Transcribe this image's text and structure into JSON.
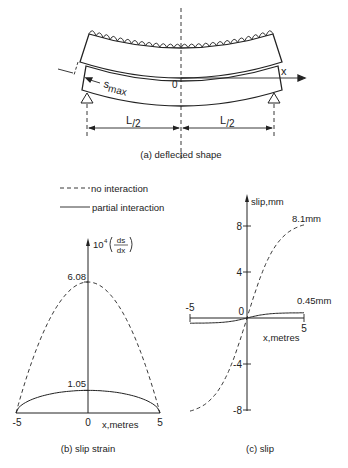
{
  "diagram_a": {
    "caption": "(a) deflected shape",
    "axis_label": "x",
    "origin_label": "0",
    "slip_label": "s",
    "slip_sub": "max",
    "half_span_left": "L",
    "half_span_right": "L",
    "half_span_den": "/2"
  },
  "legend": {
    "items": [
      {
        "label": "no interaction",
        "style": "dashed"
      },
      {
        "label": "partial interaction",
        "style": "solid"
      }
    ]
  },
  "chart_data": [
    {
      "type": "line",
      "title": "(b) slip strain",
      "xlabel": "x,metres",
      "ylabel": "10⁴(ds/dx)",
      "xlim": [
        -5,
        5
      ],
      "ylim": [
        0,
        6.5
      ],
      "x_ticks": [
        "-5",
        "0",
        "5"
      ],
      "annotations": [
        "6.08",
        "1.05"
      ],
      "series": [
        {
          "name": "no interaction",
          "style": "dashed",
          "shape": "parabola",
          "x": [
            -5,
            0,
            5
          ],
          "y": [
            0,
            6.08,
            0
          ]
        },
        {
          "name": "partial interaction",
          "style": "solid",
          "shape": "arch",
          "x": [
            -5,
            0,
            5
          ],
          "y": [
            0,
            1.05,
            0
          ]
        }
      ]
    },
    {
      "type": "line",
      "title": "(c) slip",
      "xlabel": "x,metres",
      "ylabel": "slip,mm",
      "xlim": [
        -5,
        5
      ],
      "ylim": [
        -8,
        8
      ],
      "x_ticks": [
        "-5",
        "5"
      ],
      "y_ticks": [
        "8",
        "4",
        "0",
        "-4",
        "-8"
      ],
      "annotations": [
        "8.1mm",
        "0.45mm"
      ],
      "series": [
        {
          "name": "no interaction",
          "style": "dashed",
          "x": [
            -5,
            0,
            5
          ],
          "y": [
            -8.1,
            0,
            8.1
          ]
        },
        {
          "name": "partial interaction",
          "style": "solid",
          "x": [
            -5,
            0,
            5
          ],
          "y": [
            -0.45,
            0,
            0.45
          ]
        }
      ]
    }
  ]
}
